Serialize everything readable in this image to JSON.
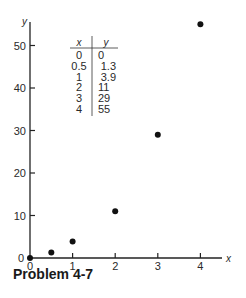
{
  "caption": "Problem 4-7",
  "chart_data": {
    "type": "scatter",
    "title": "",
    "xlabel": "x",
    "ylabel": "y",
    "xlim": [
      0,
      4.5
    ],
    "ylim": [
      0,
      57
    ],
    "grid": false,
    "x_ticks": [
      0,
      1,
      2,
      3,
      4
    ],
    "y_ticks": [
      0,
      10,
      20,
      30,
      40,
      50
    ],
    "series": [
      {
        "name": "data",
        "x": [
          0,
          0.5,
          1,
          2,
          3,
          4
        ],
        "y": [
          0,
          1.3,
          3.9,
          11,
          29,
          55
        ]
      }
    ],
    "inset_table": {
      "headers": [
        "x",
        "y"
      ],
      "rows": [
        [
          "0",
          "0"
        ],
        [
          "0.5",
          "1.3"
        ],
        [
          "1",
          "3.9"
        ],
        [
          "2",
          "11"
        ],
        [
          "3",
          "29"
        ],
        [
          "4",
          "55"
        ]
      ]
    }
  }
}
